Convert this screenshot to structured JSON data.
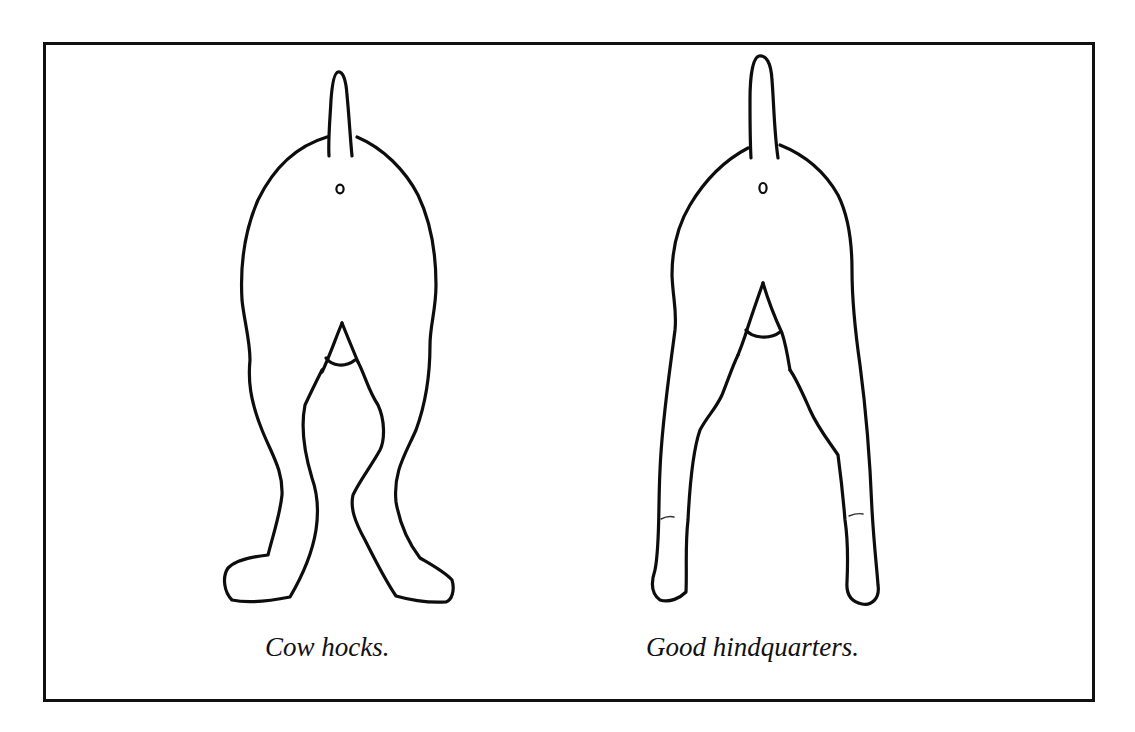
{
  "figure": {
    "panels": [
      {
        "id": "left",
        "caption": "Cow hocks.",
        "subject": "dog hindquarters viewed from behind, hocks turned inward, feet turned out"
      },
      {
        "id": "right",
        "caption": "Good hindquarters.",
        "subject": "dog hindquarters viewed from behind, legs straight and parallel"
      }
    ],
    "colors": {
      "line": "#0d0d0d",
      "background": "#ffffff"
    }
  },
  "page": {
    "truncated_text_below": ""
  }
}
